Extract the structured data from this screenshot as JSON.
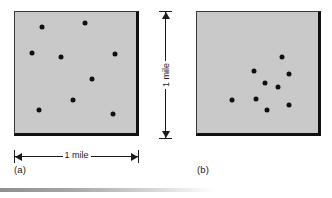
{
  "figure": {
    "dot_color": "#101010",
    "fill_color": "#c9c9c9",
    "border_color": "#111111"
  },
  "panel_a": {
    "label": "(a)",
    "square": {
      "x": 14,
      "y": 11,
      "size": 125
    },
    "dimension_label": "1 mile",
    "dot_count": "9"
  },
  "panel_b": {
    "label": "(b)",
    "square": {
      "x": 196,
      "y": 11,
      "size": 125
    },
    "dot_count": "9"
  },
  "vertical_dimension": {
    "label": "1 mile"
  },
  "chart_data": {
    "type": "scatter",
    "title": "",
    "xlabel": "1 mile",
    "ylabel": "1 mile",
    "xlim": [
      0,
      1
    ],
    "ylim": [
      0,
      1
    ],
    "grid": false,
    "legend": "none",
    "annotations": [
      "(a)",
      "(b)",
      "1 mile",
      "1 mile"
    ],
    "series": [
      {
        "name": "(a) random dispersion",
        "points": [
          [
            0.22,
            0.12
          ],
          [
            0.58,
            0.09
          ],
          [
            0.14,
            0.34
          ],
          [
            0.38,
            0.37
          ],
          [
            0.83,
            0.35
          ],
          [
            0.64,
            0.55
          ],
          [
            0.48,
            0.73
          ],
          [
            0.2,
            0.81
          ],
          [
            0.81,
            0.84
          ]
        ]
      },
      {
        "name": "(b) clustered dispersion",
        "points": [
          [
            0.7,
            0.37
          ],
          [
            0.47,
            0.49
          ],
          [
            0.76,
            0.51
          ],
          [
            0.56,
            0.59
          ],
          [
            0.67,
            0.62
          ],
          [
            0.29,
            0.73
          ],
          [
            0.49,
            0.72
          ],
          [
            0.76,
            0.77
          ],
          [
            0.58,
            0.81
          ]
        ]
      }
    ]
  }
}
